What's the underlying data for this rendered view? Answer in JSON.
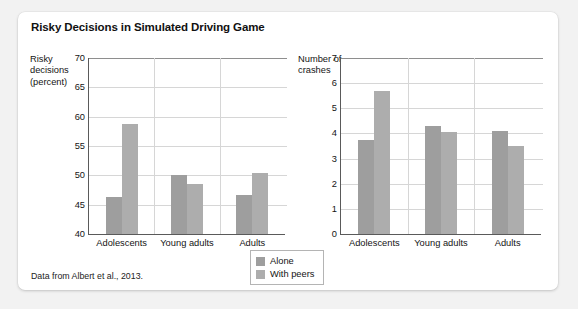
{
  "figure": {
    "title": "Risky Decisions in Simulated Driving Game",
    "source_note": "Data from Albert et al., 2013."
  },
  "legend": {
    "items": [
      {
        "label": "Alone",
        "color": "#9e9e9e"
      },
      {
        "label": "With peers",
        "color": "#adadad"
      }
    ]
  },
  "chart_data": [
    {
      "type": "bar",
      "panel": "left",
      "title": "",
      "xlabel": "",
      "ylabel": "Risky decisions (percent)",
      "ylabel_lines": [
        "Risky",
        "decisions",
        "(percent)"
      ],
      "categories": [
        "Adolescents",
        "Young adults",
        "Adults"
      ],
      "series": [
        {
          "name": "Alone",
          "values": [
            46.3,
            50.1,
            46.6
          ]
        },
        {
          "name": "With peers",
          "values": [
            58.8,
            48.6,
            50.4
          ]
        }
      ],
      "ylim": [
        40,
        70
      ],
      "yticks": [
        40,
        45,
        50,
        55,
        60,
        65,
        70
      ],
      "grid": true,
      "legend_position": "bottom-center"
    },
    {
      "type": "bar",
      "panel": "right",
      "title": "",
      "xlabel": "",
      "ylabel": "Number of crashes",
      "ylabel_lines": [
        "Number of",
        "crashes"
      ],
      "categories": [
        "Adolescents",
        "Young adults",
        "Adults"
      ],
      "series": [
        {
          "name": "Alone",
          "values": [
            3.75,
            4.3,
            4.1
          ]
        },
        {
          "name": "With peers",
          "values": [
            5.7,
            4.05,
            3.5
          ]
        }
      ],
      "ylim": [
        0,
        7
      ],
      "yticks": [
        0,
        1,
        2,
        3,
        4,
        5,
        6,
        7
      ],
      "grid": true,
      "legend_position": "bottom-center"
    }
  ]
}
